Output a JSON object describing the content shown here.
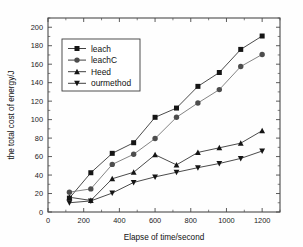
{
  "chart_data": {
    "type": "line",
    "title": "",
    "xlabel": "Elapse of time/second",
    "ylabel": "the total cost of energy/J",
    "xlim": [
      0,
      1300
    ],
    "ylim": [
      0,
      210
    ],
    "x_ticks": [
      0,
      200,
      400,
      600,
      800,
      1000,
      1200
    ],
    "y_ticks": [
      0,
      20,
      40,
      60,
      80,
      100,
      120,
      140,
      160,
      180,
      200
    ],
    "x_minor_step": 100,
    "y_minor_step": 10,
    "grid": false,
    "legend_position": "upper-left-inside",
    "x": [
      120,
      240,
      360,
      480,
      600,
      720,
      840,
      960,
      1080,
      1200
    ],
    "series": [
      {
        "name": "leach",
        "marker": "square",
        "values": [
          15,
          42.5,
          63.5,
          75,
          102.5,
          112.5,
          136,
          151,
          176,
          190.5
        ]
      },
      {
        "name": "leachC",
        "marker": "circle",
        "values": [
          21.5,
          25,
          51.5,
          62.5,
          79.5,
          102.5,
          118,
          132.5,
          157.5,
          170.5
        ]
      },
      {
        "name": "Heed",
        "marker": "triangle-up",
        "values": [
          16,
          12.5,
          36,
          43,
          62,
          51,
          64.5,
          69.5,
          74.5,
          88
        ]
      },
      {
        "name": "ourmethod",
        "marker": "triangle-down",
        "values": [
          10,
          12,
          20.5,
          32,
          38,
          43,
          48,
          52.5,
          58,
          66
        ]
      }
    ]
  },
  "legend": {
    "entries": [
      {
        "label": "leach"
      },
      {
        "label": "leachC"
      },
      {
        "label": "Heed"
      },
      {
        "label": "ourmethod"
      }
    ]
  },
  "axis": {
    "x_title": "Elapse of time/second",
    "y_title": "the total cost of energy/J",
    "x_tick_labels": [
      "0",
      "200",
      "400",
      "600",
      "800",
      "1000",
      "1200"
    ],
    "y_tick_labels": [
      "0",
      "20",
      "40",
      "60",
      "80",
      "100",
      "120",
      "140",
      "160",
      "180",
      "200"
    ]
  },
  "colors": {
    "axis": "#4a4a4a",
    "series_dark": "#151515",
    "series_grey": "#4d4d4d",
    "background": "#fefefe"
  }
}
